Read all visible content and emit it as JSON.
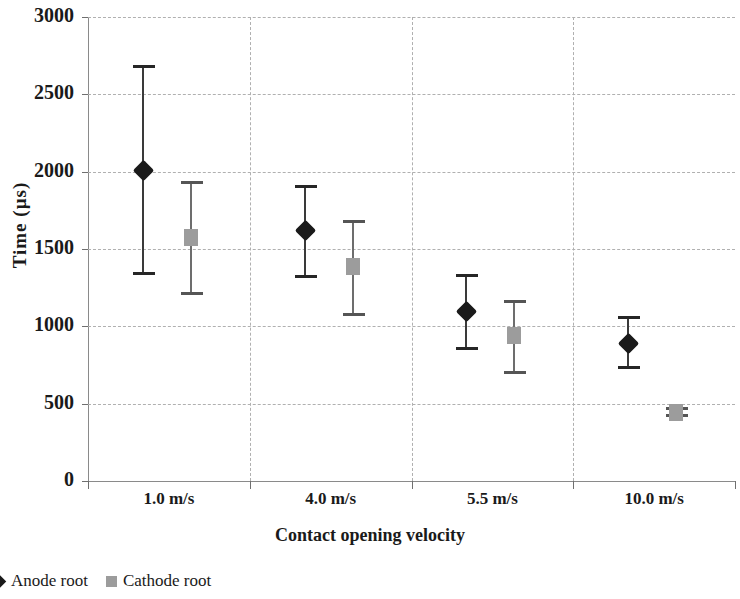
{
  "chart_data": {
    "type": "scatter",
    "title": "",
    "xlabel": "Contact opening velocity",
    "ylabel": "Time (µs)",
    "categories": [
      "1.0 m/s",
      "4.0 m/s",
      "5.5 m/s",
      "10.0 m/s"
    ],
    "ylim": [
      0,
      3000
    ],
    "ytick_labels": [
      "0",
      "500",
      "1000",
      "1500",
      "2000",
      "2500",
      "3000"
    ],
    "yticks": [
      0,
      500,
      1000,
      1500,
      2000,
      2500,
      3000
    ],
    "grid": "horizontal-and-vertical-dashed",
    "legend_position": "below-plot-left",
    "error_bars": true,
    "series": [
      {
        "name": "Anode root",
        "marker": "diamond",
        "color": "#1a1a1a",
        "values": [
          2010,
          1625,
          1100,
          895
        ],
        "err_low": [
          1330,
          1310,
          850,
          725
        ],
        "err_high": [
          2690,
          1915,
          1340,
          1070
        ]
      },
      {
        "name": "Cathode root",
        "marker": "square",
        "color": "#9c9c9c",
        "values": [
          1580,
          1390,
          945,
          445
        ],
        "err_low": [
          1200,
          1070,
          690,
          415
        ],
        "err_high": [
          1940,
          1690,
          1170,
          480
        ]
      }
    ]
  },
  "legend": {
    "items": [
      {
        "label": "Anode root",
        "marker": "diamond"
      },
      {
        "label": "Cathode root",
        "marker": "square"
      }
    ]
  },
  "axes": {
    "y_title": "Time (µs)",
    "x_title": "Contact opening velocity"
  }
}
